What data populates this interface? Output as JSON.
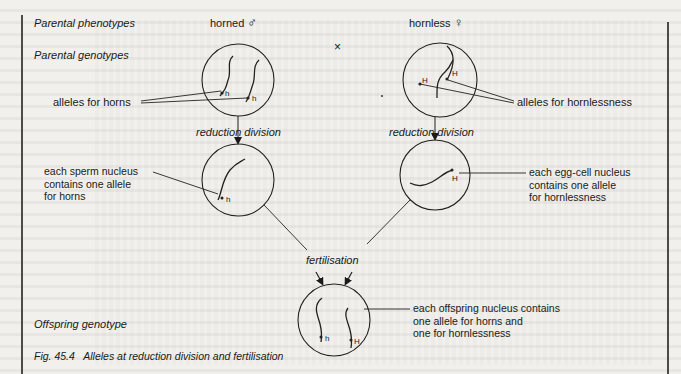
{
  "figure": {
    "caption": "Fig. 45.4   Alleles at reduction division and fertilisation",
    "row_labels": {
      "parental_phenotypes": "Parental phenotypes",
      "parental_genotypes": "Parental genotypes",
      "offspring_genotype": "Offspring genotype"
    },
    "male": {
      "phenotype": "horned",
      "sex_symbol": "♂",
      "alleles": [
        "h",
        "h"
      ],
      "allele_label": "alleles for horns"
    },
    "female": {
      "phenotype": "hornless",
      "sex_symbol": "♀",
      "alleles": [
        "H",
        "H"
      ],
      "allele_label": "alleles for hornlessness"
    },
    "cross_symbol": "×",
    "process": {
      "reduction_left": "reduction division",
      "reduction_right": "reduction division",
      "fertilisation": "fertilisation"
    },
    "gametes": {
      "sperm": {
        "allele": "h",
        "label_lines": [
          "each sperm nucleus",
          "contains one allele",
          "for horns"
        ]
      },
      "egg": {
        "allele": "H",
        "label_lines": [
          "each egg-cell nucleus",
          "contains one allele",
          "for hornlessness"
        ]
      }
    },
    "offspring": {
      "alleles": [
        "h",
        "H"
      ],
      "label_lines": [
        "each offspring nucleus contains",
        "one allele for horns and",
        "one for hornlessness"
      ]
    }
  }
}
